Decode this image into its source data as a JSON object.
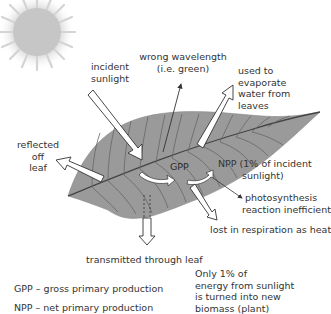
{
  "diagram": {
    "sun": "sun-icon",
    "leaf": "leaf",
    "labels": {
      "incident_sunlight_1": "incident",
      "incident_sunlight_2": "sunlight",
      "wrong_wavelength_1": "wrong wavelength",
      "wrong_wavelength_2": "(i.e. green)",
      "evaporate_1": "used to",
      "evaporate_2": "evaporate",
      "evaporate_3": "water from",
      "evaporate_4": "leaves",
      "reflected_1": "reflected",
      "reflected_2": "off",
      "reflected_3": "leaf",
      "gpp": "GPP",
      "npp_1": "NPP (1% of incident",
      "npp_2": "sunlight)",
      "inefficient_1": "photosynthesis",
      "inefficient_2": "reaction inefficient",
      "respiration": "lost in respiration as heat",
      "transmitted": "transmitted through leaf"
    },
    "key": {
      "gpp_def": "GPP – gross primary production",
      "npp_def_partial": "NPP – net primary production"
    },
    "note": {
      "line1": "Only 1% of",
      "line2": "energy from sunlight",
      "line3": "is turned into new",
      "line4": "biomass (plant)"
    },
    "colors": {
      "leaf": "#9a9a9a",
      "vein": "#555555",
      "sun": "#c8c8c8",
      "text": "#333333"
    }
  }
}
